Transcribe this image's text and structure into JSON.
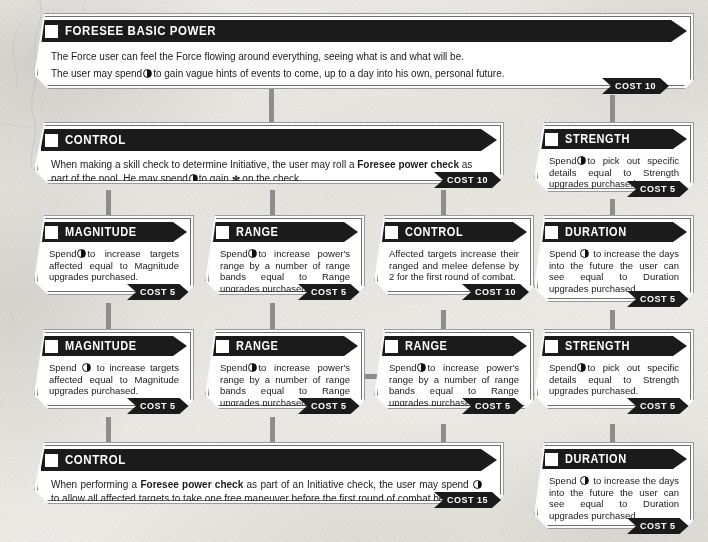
{
  "page": {
    "accent_color": "#1b1b1b",
    "paper_color": "#eceae5",
    "connector_color": "#8d8d8d"
  },
  "glyphs": {
    "force_die": "force-die-pip",
    "checkbox": "empty-checkbox",
    "triumph": "✼"
  },
  "cards": [
    {
      "id": "foresee-basic-power",
      "title": "FORESEE BASIC POWER",
      "lines": [
        "The Force user can feel the Force flowing around everything, seeing what is and what will be.",
        "The user may spend [F] to gain vague hints of events to come, up to a day into his own, personal future."
      ],
      "cost": "COST 10"
    },
    {
      "id": "control-initiative",
      "title": "CONTROL",
      "text_pre": "When making a skill check to determine Initiative, the user may roll a ",
      "text_bold": "Foresee power check",
      "text_post": " as part of the pool. He may spend [F] to gain ✼ on the check.",
      "cost": "COST 10"
    },
    {
      "id": "strength-row2",
      "title": "STRENGTH",
      "text": "Spend [F] to pick out specific details equal to Strength upgrades purchased.",
      "cost": "COST 5"
    },
    {
      "id": "magnitude-row3",
      "title": "MAGNITUDE",
      "text": "Spend [F] to increase targets affected equal to Magnitude upgrades purchased.",
      "cost": "COST 5"
    },
    {
      "id": "range-row3-a",
      "title": "RANGE",
      "text": "Spend [F] to increase power's range by a number of range bands equal to Range upgrades purchased.",
      "cost": "COST 5"
    },
    {
      "id": "control-defense",
      "title": "CONTROL",
      "text": "Affected targets increase their ranged and melee defense by 2 for the first round of combat.",
      "cost": "COST 10"
    },
    {
      "id": "duration-row3",
      "title": "DURATION",
      "text": "Spend [F] to increase the days into the future the user can see equal to Duration upgrades purchased.",
      "cost": "COST 5"
    },
    {
      "id": "magnitude-row4",
      "title": "MAGNITUDE",
      "text": "Spend [F] to increase targets affected equal to Magnitude upgrades purchased.",
      "cost": "COST 5"
    },
    {
      "id": "range-row4-a",
      "title": "RANGE",
      "text": "Spend [F] to increase power's range by a number of range bands equal to Range upgrades purchased.",
      "cost": "COST 5"
    },
    {
      "id": "range-row4-b",
      "title": "RANGE",
      "text": "Spend [F] to increase power's range by a number of range bands equal to Range upgrades purchased.",
      "cost": "COST 5"
    },
    {
      "id": "strength-row4",
      "title": "STRENGTH",
      "text": "Spend [F] to pick out specific details equal to Strength upgrades purchased.",
      "cost": "COST 5"
    },
    {
      "id": "control-maneuver",
      "title": "CONTROL",
      "text_pre": "When performing a ",
      "text_bold": "Foresee power check",
      "text_post": " as part of an Initiative check, the user may spend [F] to allow all affected targets to take one free maneuver before the first round of combat begins.",
      "cost": "COST 15"
    },
    {
      "id": "duration-row5",
      "title": "DURATION",
      "text": "Spend [F] to increase the days into the future the user can see equal to Duration upgrades purchased.",
      "cost": "COST 5"
    }
  ]
}
